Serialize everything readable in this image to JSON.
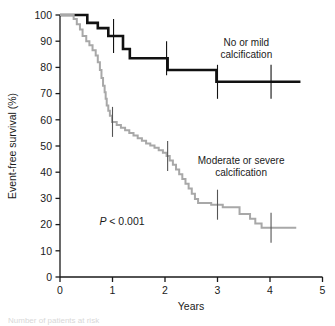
{
  "chart_data": {
    "type": "line",
    "chart_subtype": "kaplan-meier-step",
    "title": "",
    "xlabel": "Years",
    "ylabel": "Event-free survival (%)",
    "xlim": [
      0,
      5
    ],
    "ylim": [
      0,
      100
    ],
    "xticks": [
      0,
      1,
      2,
      3,
      4,
      5
    ],
    "xtick_labels": [
      "0",
      "1",
      "2",
      "3",
      "4",
      "5"
    ],
    "yticks": [
      0,
      10,
      20,
      30,
      40,
      50,
      60,
      70,
      80,
      90,
      100
    ],
    "ytick_labels": [
      "0",
      "10",
      "20",
      "30",
      "40",
      "50",
      "60",
      "70",
      "80",
      "90",
      "100"
    ],
    "grid": false,
    "legend_position": "inline-annotation",
    "annotations": [
      {
        "name": "p-value",
        "text_italic": "P",
        "text": " < 0.001",
        "x": 0.75,
        "y": 20
      },
      {
        "name": "series-label-black",
        "text": "No or mild calcification",
        "x": 3.55,
        "y": 88
      },
      {
        "name": "series-label-gray",
        "text": "Moderate or severe calcification",
        "x": 3.45,
        "y": 43
      }
    ],
    "series": [
      {
        "name": "No or mild calcification",
        "color": "#111111",
        "line_width": 2.6,
        "final_value": 74.5,
        "points": [
          [
            0.0,
            100
          ],
          [
            0.52,
            100
          ],
          [
            0.52,
            97.0
          ],
          [
            0.72,
            97.0
          ],
          [
            0.72,
            95.0
          ],
          [
            0.92,
            95.0
          ],
          [
            0.92,
            92.0
          ],
          [
            1.2,
            92.0
          ],
          [
            1.2,
            87.0
          ],
          [
            1.33,
            87.0
          ],
          [
            1.33,
            83.5
          ],
          [
            2.05,
            83.5
          ],
          [
            2.05,
            79.0
          ],
          [
            2.98,
            79.0
          ],
          [
            2.98,
            74.5
          ],
          [
            4.58,
            74.5
          ]
        ],
        "censor_marks": [
          {
            "x": 1.02,
            "y": 92.0
          },
          {
            "x": 2.03,
            "y": 83.5
          },
          {
            "x": 3.0,
            "y": 74.5
          },
          {
            "x": 4.02,
            "y": 74.5
          }
        ]
      },
      {
        "name": "Moderate or severe calcification",
        "color": "#a8a8a8",
        "line_width": 2.0,
        "final_value": 18.8,
        "points": [
          [
            0.0,
            100
          ],
          [
            0.26,
            100
          ],
          [
            0.26,
            98.5
          ],
          [
            0.32,
            98.5
          ],
          [
            0.32,
            96.5
          ],
          [
            0.38,
            96.5
          ],
          [
            0.38,
            94.5
          ],
          [
            0.43,
            94.5
          ],
          [
            0.43,
            92.0
          ],
          [
            0.5,
            92.0
          ],
          [
            0.5,
            90.0
          ],
          [
            0.56,
            90.0
          ],
          [
            0.56,
            88.5
          ],
          [
            0.62,
            88.5
          ],
          [
            0.62,
            86.5
          ],
          [
            0.68,
            86.5
          ],
          [
            0.68,
            84.5
          ],
          [
            0.72,
            84.5
          ],
          [
            0.72,
            82.0
          ],
          [
            0.76,
            82.0
          ],
          [
            0.76,
            79.0
          ],
          [
            0.79,
            79.0
          ],
          [
            0.79,
            76.0
          ],
          [
            0.82,
            76.0
          ],
          [
            0.82,
            73.0
          ],
          [
            0.85,
            73.0
          ],
          [
            0.85,
            70.5
          ],
          [
            0.87,
            70.5
          ],
          [
            0.87,
            68.0
          ],
          [
            0.89,
            68.0
          ],
          [
            0.89,
            65.5
          ],
          [
            0.92,
            65.5
          ],
          [
            0.92,
            63.5
          ],
          [
            0.95,
            63.5
          ],
          [
            0.95,
            61.5
          ],
          [
            0.99,
            61.5
          ],
          [
            0.99,
            59.2
          ],
          [
            1.08,
            59.2
          ],
          [
            1.08,
            58.0
          ],
          [
            1.16,
            58.0
          ],
          [
            1.16,
            57.0
          ],
          [
            1.24,
            57.0
          ],
          [
            1.24,
            56.0
          ],
          [
            1.32,
            56.0
          ],
          [
            1.32,
            55.0
          ],
          [
            1.4,
            55.0
          ],
          [
            1.4,
            54.0
          ],
          [
            1.48,
            54.0
          ],
          [
            1.48,
            53.0
          ],
          [
            1.56,
            53.0
          ],
          [
            1.56,
            52.0
          ],
          [
            1.64,
            52.0
          ],
          [
            1.64,
            51.0
          ],
          [
            1.72,
            51.0
          ],
          [
            1.72,
            50.2
          ],
          [
            1.8,
            50.2
          ],
          [
            1.8,
            49.3
          ],
          [
            1.88,
            49.3
          ],
          [
            1.88,
            48.4
          ],
          [
            1.96,
            48.4
          ],
          [
            1.96,
            47.4
          ],
          [
            2.03,
            47.4
          ],
          [
            2.03,
            46.2
          ],
          [
            2.09,
            46.2
          ],
          [
            2.09,
            44.5
          ],
          [
            2.15,
            44.5
          ],
          [
            2.15,
            42.8
          ],
          [
            2.21,
            42.8
          ],
          [
            2.21,
            41.0
          ],
          [
            2.27,
            41.0
          ],
          [
            2.27,
            39.2
          ],
          [
            2.33,
            39.2
          ],
          [
            2.33,
            37.4
          ],
          [
            2.39,
            37.4
          ],
          [
            2.39,
            35.6
          ],
          [
            2.45,
            35.6
          ],
          [
            2.45,
            33.8
          ],
          [
            2.51,
            33.8
          ],
          [
            2.51,
            31.8
          ],
          [
            2.57,
            31.8
          ],
          [
            2.57,
            29.8
          ],
          [
            2.63,
            29.8
          ],
          [
            2.63,
            28.2
          ],
          [
            2.88,
            28.2
          ],
          [
            2.88,
            27.6
          ],
          [
            3.1,
            27.6
          ],
          [
            3.1,
            26.6
          ],
          [
            3.42,
            26.6
          ],
          [
            3.42,
            24.0
          ],
          [
            3.62,
            24.0
          ],
          [
            3.62,
            22.2
          ],
          [
            3.72,
            22.2
          ],
          [
            3.72,
            20.4
          ],
          [
            3.84,
            20.4
          ],
          [
            3.84,
            18.8
          ],
          [
            4.5,
            18.8
          ]
        ],
        "censor_marks": [
          {
            "x": 1.0,
            "y": 59.2
          },
          {
            "x": 2.05,
            "y": 46.2
          },
          {
            "x": 3.0,
            "y": 27.6
          },
          {
            "x": 4.02,
            "y": 18.8
          }
        ]
      }
    ]
  },
  "axes": {
    "x_title": "Years",
    "y_title": "Event-free survival (%)"
  },
  "caption": {
    "cut_off_text": "Number of patients at risk"
  },
  "colors": {
    "series_black": "#111111",
    "series_gray": "#a8a8a8",
    "axis": "#1a1a1a",
    "background": "#ffffff"
  }
}
